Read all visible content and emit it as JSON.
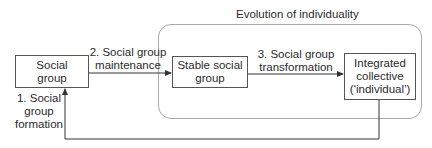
{
  "diagram": {
    "region_title": "Evolution of individuality",
    "nodes": [
      {
        "id": "social-group",
        "lines": [
          "Social",
          "group"
        ]
      },
      {
        "id": "stable-social-group",
        "lines": [
          "Stable social",
          "group"
        ]
      },
      {
        "id": "integrated-collective",
        "lines": [
          "Integrated",
          "collective",
          "(‘individual’)"
        ]
      }
    ],
    "edges": [
      {
        "from": "integrated-collective",
        "to": "social-group",
        "lines": [
          "1. Social",
          "group",
          "formation"
        ]
      },
      {
        "from": "social-group",
        "to": "stable-social-group",
        "lines": [
          "2. Social group",
          "maintenance"
        ]
      },
      {
        "from": "stable-social-group",
        "to": "integrated-collective",
        "lines": [
          "3. Social group",
          "transformation"
        ]
      }
    ],
    "colors": {
      "box_border": "#555555",
      "region_border": "#a9a9a9",
      "arrow": "#333333",
      "text": "#2a2a2a"
    }
  }
}
